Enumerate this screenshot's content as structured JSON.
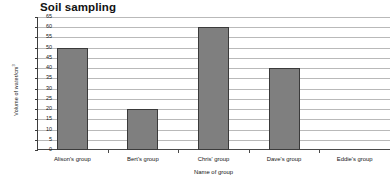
{
  "chart_data": {
    "type": "bar",
    "title": "Soil sampling",
    "xlabel": "Name of group",
    "ylabel": "Volume of water/cm",
    "ylabel_superscript": "3",
    "categories": [
      "Alison's group",
      "Bert's group",
      "Chris' group",
      "Dave's group",
      "Eddie's group"
    ],
    "values": [
      50,
      20,
      60,
      40,
      0
    ],
    "ylim": [
      0,
      65
    ],
    "ytick_step": 5,
    "yticks": [
      0,
      5,
      10,
      15,
      20,
      25,
      30,
      35,
      40,
      45,
      50,
      55,
      60,
      65
    ],
    "ytick_labels": [
      "0",
      "5",
      "10",
      "15",
      "20",
      "25",
      "30",
      "35",
      "40",
      "45",
      "50",
      "55",
      "60",
      "65"
    ],
    "grid": true,
    "legend": false,
    "bar_color": "#7f7f7f",
    "bar_edge_color": "#3a3a3a",
    "gridline_color": "#b9b9b9",
    "axis_color": "#3d3d3d"
  }
}
